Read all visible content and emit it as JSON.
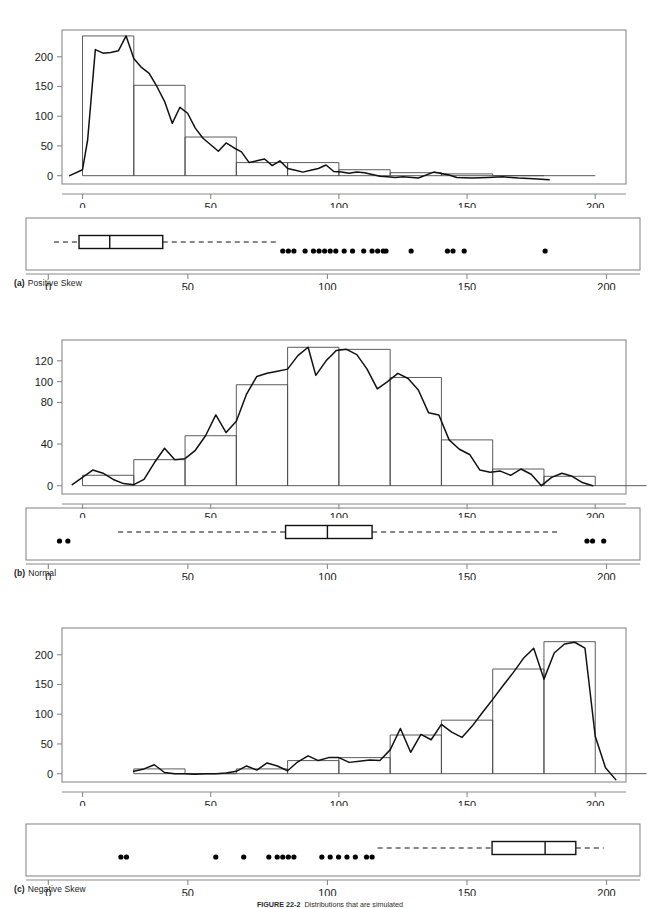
{
  "figure": {
    "caption_number": "FIGURE 22-2",
    "caption_text": "Distributions that are simulated"
  },
  "panels": [
    {
      "id": "a",
      "tag": "(a)",
      "label": "Positive Skew",
      "hist_yticks": [
        0,
        50,
        100,
        150,
        200
      ],
      "hist_xticks": [
        0,
        50,
        100,
        150,
        200
      ],
      "box_xticks": [
        0,
        50,
        100,
        150,
        200
      ]
    },
    {
      "id": "b",
      "tag": "(b)",
      "label": "Normal",
      "hist_yticks": [
        0,
        40,
        80,
        100,
        120
      ],
      "hist_xticks": [
        0,
        50,
        100,
        150,
        200
      ],
      "box_xticks": [
        0,
        50,
        100,
        150,
        200
      ]
    },
    {
      "id": "c",
      "tag": "(c)",
      "label": "Negative Skew",
      "hist_yticks": [
        0,
        50,
        100,
        150,
        200
      ],
      "hist_xticks": [
        0,
        50,
        100,
        150,
        200
      ],
      "box_xticks": [
        0,
        50,
        100,
        150,
        200
      ]
    }
  ],
  "chart_data": [
    {
      "type": "bar",
      "id": "hist-a",
      "title": "Positive Skew",
      "xlabel": "",
      "ylabel": "",
      "xlim": [
        -8,
        212
      ],
      "ylim": [
        -14,
        245
      ],
      "grid": false,
      "legend": false,
      "bin_width": 20,
      "bin_edges": [
        0,
        20,
        40,
        60,
        80,
        100,
        120,
        140,
        160,
        180
      ],
      "categories": [
        "0-20",
        "20-40",
        "40-60",
        "60-80",
        "80-100",
        "100-120",
        "120-140",
        "140-160",
        "160-180"
      ],
      "values": [
        235,
        152,
        65,
        22,
        22,
        10,
        5,
        3,
        0
      ],
      "overlay_curve": {
        "name": "smoothed frequency polygon",
        "x": [
          -5,
          0,
          2,
          5,
          8,
          11,
          14,
          17,
          20,
          23,
          26,
          29,
          32,
          35,
          38,
          41,
          44,
          47,
          50,
          53,
          56,
          59,
          62,
          65,
          68,
          71,
          74,
          77,
          80,
          83,
          86,
          89,
          92,
          95,
          98,
          101,
          104,
          107,
          110,
          113,
          116,
          119,
          122,
          125,
          131,
          137,
          143,
          146,
          152,
          158,
          164,
          170,
          176,
          182
        ],
        "y": [
          0,
          10,
          60,
          212,
          206,
          207,
          210,
          235,
          197,
          182,
          172,
          150,
          125,
          88,
          115,
          105,
          80,
          63,
          52,
          41,
          55,
          47,
          40,
          22,
          25,
          28,
          17,
          25,
          12,
          9,
          6,
          9,
          12,
          18,
          7,
          6,
          4,
          6,
          5,
          2,
          -1,
          -2,
          -3,
          -2,
          -4,
          6,
          1,
          -3,
          -4,
          -3,
          -2,
          -4,
          -5,
          -7
        ]
      }
    },
    {
      "type": "boxplot",
      "id": "box-a",
      "title": "Positive Skew box plot",
      "xlim": [
        -8,
        212
      ],
      "whisker_low": 2,
      "q1": 11,
      "median": 22,
      "q3": 41,
      "whisker_high": 82,
      "outliers": [
        84,
        86,
        88,
        92,
        95,
        97,
        99,
        101,
        103,
        106,
        109,
        113,
        116,
        118,
        120,
        121,
        130,
        143,
        145,
        149,
        178
      ]
    },
    {
      "type": "bar",
      "id": "hist-b",
      "title": "Normal",
      "xlabel": "",
      "ylabel": "",
      "xlim": [
        -8,
        212
      ],
      "ylim": [
        -8,
        140
      ],
      "grid": false,
      "legend": false,
      "bin_width": 20,
      "bin_edges": [
        0,
        20,
        40,
        60,
        80,
        100,
        120,
        140,
        160,
        180,
        200
      ],
      "categories": [
        "0-20",
        "20-40",
        "40-60",
        "60-80",
        "80-100",
        "100-120",
        "120-140",
        "140-160",
        "160-180",
        "180-200"
      ],
      "values": [
        10,
        25,
        48,
        97,
        133,
        131,
        104,
        44,
        16,
        9
      ],
      "overlay_curve": {
        "name": "smoothed frequency polygon",
        "x": [
          -4,
          0,
          4,
          8,
          12,
          16,
          20,
          24,
          28,
          32,
          36,
          40,
          44,
          48,
          52,
          56,
          60,
          64,
          68,
          72,
          76,
          80,
          84,
          88,
          91,
          95,
          99,
          103,
          107,
          111,
          115,
          119,
          123,
          127,
          131,
          135,
          139,
          143,
          147,
          151,
          155,
          159,
          163,
          167,
          171,
          175,
          179,
          183,
          187,
          191,
          195,
          199
        ],
        "y": [
          1,
          8,
          15,
          12,
          6,
          2,
          1,
          6,
          22,
          36,
          25,
          26,
          34,
          48,
          68,
          51,
          62,
          88,
          105,
          108,
          110,
          112,
          125,
          133,
          106,
          120,
          130,
          131,
          126,
          112,
          93,
          100,
          108,
          103,
          92,
          70,
          68,
          44,
          35,
          30,
          15,
          13,
          14,
          10,
          16,
          11,
          0,
          8,
          12,
          9,
          3,
          0
        ]
      }
    },
    {
      "type": "boxplot",
      "id": "box-b",
      "title": "Normal box plot",
      "xlim": [
        -8,
        212
      ],
      "whisker_low": 25,
      "q1": 85,
      "median": 100,
      "q3": 116,
      "whisker_high": 183,
      "outliers": [
        4,
        7,
        193,
        195,
        199
      ]
    },
    {
      "type": "bar",
      "id": "hist-c",
      "title": "Negative Skew",
      "xlabel": "",
      "ylabel": "",
      "xlim": [
        -8,
        212
      ],
      "ylim": [
        -14,
        245
      ],
      "grid": false,
      "legend": false,
      "bin_width": 20,
      "bin_edges": [
        20,
        40,
        60,
        80,
        100,
        120,
        140,
        160,
        180,
        200
      ],
      "categories": [
        "20-40",
        "40-60",
        "60-80",
        "80-100",
        "100-120",
        "120-140",
        "140-160",
        "160-180",
        "180-200"
      ],
      "values": [
        8,
        0,
        8,
        22,
        27,
        65,
        90,
        176,
        222
      ],
      "overlay_curve": {
        "name": "smoothed frequency polygon",
        "x": [
          20,
          24,
          28,
          32,
          36,
          40,
          44,
          48,
          52,
          56,
          60,
          64,
          68,
          72,
          76,
          80,
          84,
          88,
          92,
          96,
          100,
          104,
          108,
          112,
          116,
          120,
          124,
          128,
          132,
          136,
          140,
          144,
          148,
          152,
          156,
          160,
          164,
          168,
          172,
          176,
          180,
          184,
          188,
          192,
          196,
          200,
          204,
          208
        ],
        "y": [
          4,
          8,
          15,
          2,
          0,
          0,
          -1,
          0,
          0,
          1,
          4,
          13,
          6,
          18,
          13,
          5,
          20,
          30,
          22,
          27,
          27,
          19,
          21,
          23,
          22,
          40,
          76,
          36,
          66,
          57,
          83,
          70,
          61,
          80,
          103,
          125,
          148,
          170,
          194,
          211,
          159,
          203,
          218,
          221,
          211,
          63,
          10,
          -10
        ]
      }
    },
    {
      "type": "boxplot",
      "id": "box-c",
      "title": "Negative Skew box plot",
      "xlim": [
        -8,
        212
      ],
      "whisker_low": 118,
      "q1": 159,
      "median": 178,
      "q3": 189,
      "whisker_high": 199,
      "outliers": [
        26,
        28,
        60,
        70,
        79,
        82,
        84,
        86,
        88,
        98,
        101,
        104,
        107,
        110,
        114,
        116
      ]
    }
  ]
}
